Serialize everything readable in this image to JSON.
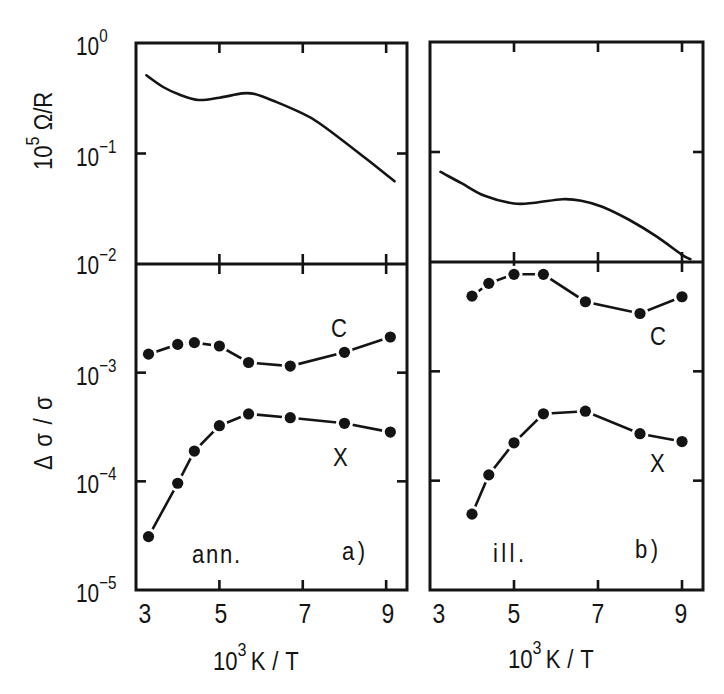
{
  "figure": {
    "y_axis_top": {
      "base": "10",
      "exp": "5",
      "rest": " Ω/R"
    },
    "y_axis_bottom": "Δσ/σ",
    "x_axis": {
      "base": "10",
      "exp": "3",
      "rest": "K/T"
    },
    "y_ticks_top": [
      {
        "base": "10",
        "exp": "0"
      },
      {
        "base": "10",
        "exp": "−1"
      },
      {
        "base": "10",
        "exp": "−2"
      }
    ],
    "y_ticks_bottom": [
      {
        "base": "10",
        "exp": "−3"
      },
      {
        "base": "10",
        "exp": "−4"
      },
      {
        "base": "10",
        "exp": "−5"
      }
    ],
    "x_ticks": [
      "3",
      "5",
      "7",
      "9"
    ],
    "panels": [
      {
        "id": "a",
        "label": "a)",
        "condition": "ann.",
        "series_labels": {
          "C": "C",
          "X": "X"
        }
      },
      {
        "id": "b",
        "label": "b)",
        "condition": "ill.",
        "series_labels": {
          "C": "C",
          "X": "X"
        }
      }
    ],
    "colors": {
      "ink": "#141414",
      "background": "#ffffff"
    }
  },
  "chart_data": [
    {
      "panel": "a",
      "subplot": "top",
      "type": "line",
      "title": "",
      "xlabel": "10^3 K/T",
      "ylabel": "10^5 Ω/R",
      "xlim": [
        3,
        9.5
      ],
      "ylim": [
        0.01,
        1
      ],
      "yscale": "log",
      "grid": false,
      "x_ticks": [
        3,
        5,
        7,
        9
      ],
      "y_ticks": [
        1,
        0.1,
        0.01
      ],
      "series": [
        {
          "name": "ann.",
          "x": [
            3.25,
            3.65,
            4.05,
            4.5,
            5.0,
            5.55,
            5.85,
            6.35,
            6.9,
            7.4,
            8.5,
            9.2
          ],
          "y": [
            0.51,
            0.4,
            0.34,
            0.305,
            0.32,
            0.35,
            0.345,
            0.294,
            0.239,
            0.188,
            0.091,
            0.056
          ]
        }
      ]
    },
    {
      "panel": "a",
      "subplot": "bottom",
      "type": "line",
      "markers": "filled-circle",
      "title": "",
      "xlabel": "10^3 K/T",
      "ylabel": "Δσ/σ",
      "xlim": [
        3,
        9.5
      ],
      "ylim": [
        1e-05,
        0.01
      ],
      "yscale": "log",
      "grid": false,
      "x_ticks": [
        3,
        5,
        7,
        9
      ],
      "y_ticks": [
        0.01,
        0.001,
        0.0001,
        1e-05
      ],
      "annotations": [
        "ann.",
        "a)"
      ],
      "series": [
        {
          "name": "C",
          "x": [
            3.3,
            4.0,
            4.4,
            5.0,
            5.7,
            6.7,
            8.0,
            9.1
          ],
          "y": [
            0.00148,
            0.00182,
            0.00189,
            0.00176,
            0.00124,
            0.00115,
            0.00154,
            0.00213
          ]
        },
        {
          "name": "X",
          "x": [
            3.3,
            4.0,
            4.4,
            5.0,
            5.7,
            6.7,
            8.0,
            9.1
          ],
          "y": [
            3.1e-05,
            9.6e-05,
            0.00019,
            0.000325,
            0.000417,
            0.000385,
            0.000342,
            0.000284
          ]
        }
      ]
    },
    {
      "panel": "b",
      "subplot": "top",
      "type": "line",
      "title": "",
      "xlabel": "10^3 K/T",
      "ylabel": "10^5 Ω/R",
      "xlim": [
        3,
        9.5
      ],
      "ylim": [
        0.01,
        1
      ],
      "yscale": "log",
      "grid": false,
      "x_ticks": [
        3,
        5,
        7,
        9
      ],
      "y_ticks": [
        1,
        0.1,
        0.01
      ],
      "series": [
        {
          "name": "ill.",
          "x": [
            3.25,
            3.75,
            4.3,
            5.0,
            5.5,
            6.15,
            6.6,
            7.1,
            7.75,
            8.4,
            9.0,
            9.2
          ],
          "y": [
            0.066,
            0.052,
            0.04,
            0.034,
            0.0346,
            0.0372,
            0.0361,
            0.0318,
            0.0241,
            0.017,
            0.0116,
            0.0106
          ]
        }
      ]
    },
    {
      "panel": "b",
      "subplot": "bottom",
      "type": "line",
      "markers": "filled-circle",
      "title": "",
      "xlabel": "10^3 K/T",
      "ylabel": "Δσ/σ",
      "xlim": [
        3,
        9.5
      ],
      "ylim": [
        1e-05,
        0.01
      ],
      "yscale": "log",
      "grid": false,
      "x_ticks": [
        3,
        5,
        7,
        9
      ],
      "y_ticks": [
        0.01,
        0.001,
        0.0001,
        1e-05
      ],
      "annotations": [
        "ill.",
        "b)"
      ],
      "series": [
        {
          "name": "C",
          "x": [
            4.0,
            4.4,
            5.0,
            5.7,
            6.7,
            8.0,
            9.0
          ],
          "y": [
            0.00487,
            0.00638,
            0.00771,
            0.00771,
            0.00433,
            0.00338,
            0.00481
          ]
        },
        {
          "name": "X",
          "x": [
            4.0,
            4.4,
            5.0,
            5.7,
            6.7,
            8.0,
            9.0
          ],
          "y": [
            4.94e-05,
            0.000113,
            0.000222,
            0.000409,
            0.000432,
            0.000269,
            0.000228
          ]
        }
      ]
    }
  ]
}
